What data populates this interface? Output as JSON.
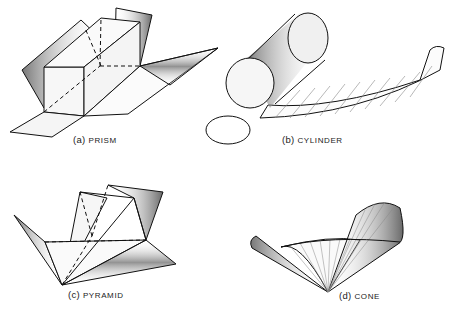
{
  "figures": [
    {
      "id": "a",
      "prefix": "(a)",
      "name": "PRISM"
    },
    {
      "id": "b",
      "prefix": "(b)",
      "name": "CYLINDER"
    },
    {
      "id": "c",
      "prefix": "(c)",
      "name": "PYRAMID"
    },
    {
      "id": "d",
      "prefix": "(d)",
      "name": "CONE"
    }
  ]
}
